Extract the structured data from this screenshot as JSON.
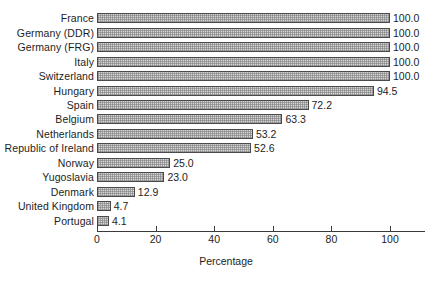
{
  "chart_data": {
    "type": "bar",
    "orientation": "horizontal",
    "title": "",
    "subtitle": "",
    "xlabel": "Percentage",
    "ylabel": "",
    "xlim": [
      0,
      112
    ],
    "ylim": null,
    "grid": false,
    "legend": null,
    "xticks": [
      0,
      20,
      40,
      60,
      80,
      100
    ],
    "xtick_labels": [
      "0",
      "20",
      "40",
      "60",
      "80",
      "100"
    ],
    "value_label_format": "one-decimal",
    "categories": [
      "France",
      "Germany (DDR)",
      "Germany (FRG)",
      "Italy",
      "Switzerland",
      "Hungary",
      "Spain",
      "Belgium",
      "Netherlands",
      "Republic of Ireland",
      "Norway",
      "Yugoslavia",
      "Denmark",
      "United Kingdom",
      "Portugal"
    ],
    "values": [
      100.0,
      100.0,
      100.0,
      100.0,
      100.0,
      94.5,
      72.2,
      63.3,
      53.2,
      52.6,
      25.0,
      23.0,
      12.9,
      4.7,
      4.1
    ],
    "value_labels": [
      "100.0",
      "100.0",
      "100.0",
      "100.0",
      "100.0",
      "94.5",
      "72.2",
      "63.3",
      "53.2",
      "52.6",
      "25.0",
      "23.0",
      "12.9",
      "4.7",
      "4.1"
    ],
    "colors": {
      "bar_fill": "#d6d6d6",
      "bar_edge": "#4a4a4a",
      "axis": "#3a3a3a",
      "text": "#1d1d1d",
      "background": "#ffffff"
    }
  }
}
